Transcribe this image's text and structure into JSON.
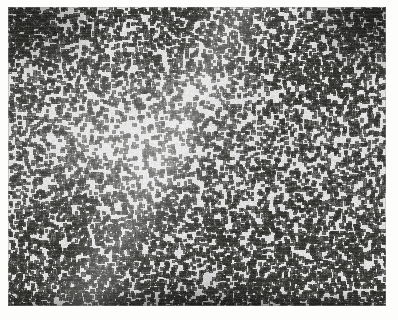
{
  "document": {
    "kind": "scanned-micrograph-plate",
    "background_color": "#fdfdfc",
    "caption": ""
  },
  "plate": {
    "label": "",
    "frame": {
      "x": 8,
      "y": 7,
      "width": 378,
      "height": 299
    },
    "media": "grayscale photomicrograph",
    "background_color": "#dcdcda",
    "stipple_color": "#3a3a38",
    "highlight_color": "#f2f2f0",
    "shadow_color": "#232321"
  },
  "chart_data": {
    "type": "heatmap",
    "title": "",
    "xlabel": "",
    "ylabel": "",
    "grid": false,
    "legend": "none",
    "colormap": [
      "#ffffff",
      "#e6e6e4",
      "#c9c9c6",
      "#9a9a97",
      "#6a6a67",
      "#3a3a38",
      "#1c1c1a"
    ],
    "value_range": [
      0.0,
      1.0
    ],
    "units": "normalized optical density",
    "field": {
      "width": 378,
      "height": 299,
      "particle_color": "#32322f",
      "matrix_color": "#dedede",
      "mean_density": 0.46,
      "particle_size_px": [
        2,
        4
      ],
      "particle_count_estimate": 6400
    },
    "regions": [
      {
        "name": "top-left-corner",
        "cx": 0.05,
        "cy": 0.04,
        "rx": 0.16,
        "ry": 0.16,
        "density": 0.78
      },
      {
        "name": "top-right-corner",
        "cx": 0.96,
        "cy": 0.04,
        "rx": 0.13,
        "ry": 0.15,
        "density": 0.84
      },
      {
        "name": "upper-right-field",
        "cx": 0.84,
        "cy": 0.22,
        "rx": 0.18,
        "ry": 0.18,
        "density": 0.66
      },
      {
        "name": "center-left-clearing",
        "cx": 0.3,
        "cy": 0.44,
        "rx": 0.22,
        "ry": 0.2,
        "density": 0.27
      },
      {
        "name": "upper-diagonal-streak",
        "cx": 0.52,
        "cy": 0.28,
        "rx": 0.26,
        "ry": 0.07,
        "density": 0.24
      },
      {
        "name": "lower-left-field",
        "cx": 0.16,
        "cy": 0.78,
        "rx": 0.2,
        "ry": 0.18,
        "density": 0.58
      },
      {
        "name": "lower-right-field",
        "cx": 0.82,
        "cy": 0.8,
        "rx": 0.2,
        "ry": 0.18,
        "density": 0.6
      },
      {
        "name": "bottom-dense-band",
        "cx": 0.5,
        "cy": 0.99,
        "rx": 0.52,
        "ry": 0.05,
        "density": 0.8
      }
    ],
    "gradient_stops": [
      {
        "position": 0.0,
        "value": 0.62
      },
      {
        "position": 0.14,
        "value": 0.5
      },
      {
        "position": 0.45,
        "value": 0.41
      },
      {
        "position": 0.72,
        "value": 0.5
      },
      {
        "position": 0.92,
        "value": 0.62
      },
      {
        "position": 1.0,
        "value": 0.74
      }
    ]
  }
}
